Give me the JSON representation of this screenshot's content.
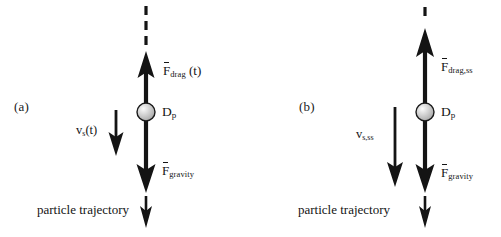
{
  "figure": {
    "type": "physics-force-diagram",
    "width": 501,
    "height": 237,
    "background": "#ffffff",
    "ink": "#141414"
  },
  "panels": [
    {
      "id": "a",
      "label": "(a)",
      "state": "transient",
      "particle": {
        "diameter_label": "D",
        "diameter_subscript": "p",
        "fill": "#c9c9c9",
        "highlight": "#f2f2f2",
        "stroke": "#1a1a1a",
        "radius_px": 9
      },
      "drag": {
        "symbol": "F",
        "subscript": "drag",
        "argument": "(t)",
        "direction": "up",
        "relative_length": "short"
      },
      "gravity": {
        "symbol": "F",
        "subscript": "gravity",
        "direction": "down",
        "relative_length": "long"
      },
      "velocity": {
        "symbol": "v",
        "subscript": "s",
        "argument": "(t)",
        "direction": "down",
        "relative_length": "short"
      },
      "trajectory": {
        "label": "particle trajectory",
        "direction": "down"
      },
      "axis": {
        "style": "dashed",
        "dash_count": 3,
        "position": "above-drag-arrow"
      }
    },
    {
      "id": "b",
      "label": "(b)",
      "state": "steady-state",
      "particle": {
        "diameter_label": "D",
        "diameter_subscript": "p",
        "fill": "#c9c9c9",
        "highlight": "#f2f2f2",
        "stroke": "#1a1a1a",
        "radius_px": 9
      },
      "drag": {
        "symbol": "F",
        "subscript": "drag,ss",
        "argument": "",
        "direction": "up",
        "relative_length": "long"
      },
      "gravity": {
        "symbol": "F",
        "subscript": "gravity",
        "direction": "down",
        "relative_length": "long"
      },
      "velocity": {
        "symbol": "v",
        "subscript": "s,ss",
        "argument": "",
        "direction": "down",
        "relative_length": "long"
      },
      "trajectory": {
        "label": "particle trajectory",
        "direction": "down"
      },
      "axis": {
        "style": "dashed",
        "dash_count": 1,
        "position": "above-drag-arrow"
      }
    }
  ]
}
